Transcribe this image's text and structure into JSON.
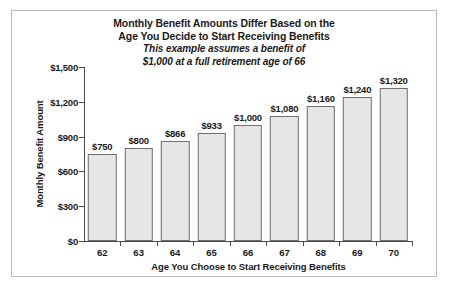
{
  "chart_data": {
    "type": "bar",
    "title": "Monthly Benefit Amounts Differ Based on the Age You Decide to Start Receiving Benefits",
    "title_lines": [
      "Monthly Benefit Amounts Differ Based on the",
      "Age You Decide to Start Receiving Benefits"
    ],
    "subtitle": "This example assumes a benefit of $1,000 at a full retirement age of 66",
    "subtitle_lines": [
      "This example assumes a benefit of",
      "$1,000 at a full retirement age of 66"
    ],
    "xlabel": "Age You Choose to Start Receiving Benefits",
    "ylabel": "Monthly Benefit Amount",
    "categories": [
      "62",
      "63",
      "64",
      "65",
      "66",
      "67",
      "68",
      "69",
      "70"
    ],
    "values": [
      750,
      800,
      866,
      933,
      1000,
      1080,
      1160,
      1240,
      1320
    ],
    "value_labels": [
      "$750",
      "$800",
      "$866",
      "$933",
      "$1,000",
      "$1,080",
      "$1,160",
      "$1,240",
      "$1,320"
    ],
    "ylim": [
      0,
      1500
    ],
    "yticks": [
      0,
      300,
      600,
      900,
      1200,
      1500
    ],
    "ytick_labels": [
      "$0",
      "$300",
      "$600",
      "$900",
      "$1,200",
      "$1,500"
    ],
    "grid": false,
    "legend": "none",
    "bar_fill_color": "#e6e6e6",
    "bar_edge_color": "#6f6f6f",
    "text_color": "#1a1a1a",
    "frame_color": "#b9b9b9",
    "background_color": "#ffffff"
  }
}
